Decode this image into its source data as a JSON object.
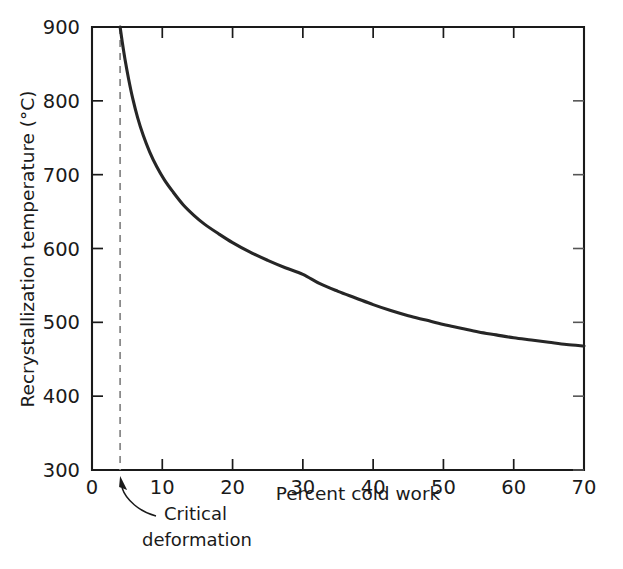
{
  "chart_data": {
    "type": "line",
    "title": "",
    "xlabel": "Percent cold work",
    "ylabel": "Recrystallization temperature (°C)",
    "xlim": [
      0,
      70
    ],
    "ylim": [
      300,
      900
    ],
    "grid": false,
    "legend": null,
    "xticks": [
      0,
      10,
      20,
      30,
      40,
      50,
      60,
      70
    ],
    "xtick_labels": [
      "0",
      "10",
      "20",
      "30",
      "40",
      "50",
      "60",
      "70"
    ],
    "yticks": [
      300,
      400,
      500,
      600,
      700,
      800,
      900
    ],
    "ytick_labels": [
      "300",
      "400",
      "500",
      "600",
      "700",
      "800",
      "900"
    ],
    "series": [
      {
        "name": "Recrystallization temperature",
        "color": "#262626",
        "x": [
          4.0,
          4.3,
          4.7,
          5.2,
          5.8,
          6.5,
          7.3,
          8.2,
          9.2,
          10.3,
          11.5,
          13.0,
          14.5,
          16.0,
          18.0,
          20.0,
          22.5,
          25.0,
          27.5,
          30.0,
          32.5,
          35.0,
          37.5,
          40.0,
          42.5,
          45.0,
          47.5,
          50.0,
          52.5,
          55.0,
          57.5,
          60.0,
          62.5,
          65.0,
          67.5,
          70.0
        ],
        "y": [
          900,
          880,
          856,
          830,
          803,
          777,
          753,
          731,
          711,
          693,
          677,
          659,
          645,
          633,
          620,
          608,
          595,
          584,
          574,
          565,
          552,
          542,
          533,
          524,
          516,
          509,
          503,
          497,
          492,
          487,
          483,
          479,
          476,
          473,
          470,
          468
        ]
      }
    ],
    "annotations": [
      {
        "name": "critical-deformation",
        "text_line1": "Critical",
        "text_line2": "deformation",
        "points_to_x": 4,
        "points_to_y": 300,
        "marker": "dashed vertical line at x = 4"
      }
    ],
    "reference_lines": [
      {
        "name": "critical-deformation-line",
        "orientation": "vertical",
        "x": 4,
        "style": "dashed",
        "color": "#8a8a8a"
      }
    ]
  },
  "axis": {
    "x_title": "Percent cold work",
    "y_title": "Recrystallization temperature (°C)",
    "x_labels": [
      "0",
      "10",
      "20",
      "30",
      "40",
      "50",
      "60",
      "70"
    ],
    "y_labels": [
      "900",
      "800",
      "700",
      "600",
      "500",
      "400",
      "300"
    ]
  },
  "annotation": {
    "line1": "Critical",
    "line2": "deformation"
  },
  "colors": {
    "curve": "#262626",
    "axis": "#1a1a1a",
    "dashed": "#8a8a8a",
    "background": "#ffffff"
  }
}
